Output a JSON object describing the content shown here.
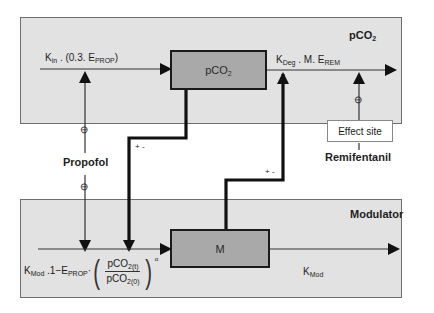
{
  "diagram": {
    "top_panel": {
      "title": "pCO",
      "title_sub": "2",
      "box_label": "pCO",
      "box_label_sub": "2",
      "input_flow": {
        "k": "K",
        "k_sub": "in",
        "rest": " . (0.3. E",
        "e_sub": "PROP",
        "close": ")"
      },
      "output_flow": {
        "k": "K",
        "k_sub": "Deg",
        "rest": " . M. E",
        "e_sub": "REM"
      },
      "effect_site_label": "Effect site"
    },
    "bottom_panel": {
      "title": "Modulator",
      "box_label": "M",
      "input_flow": {
        "k": "K",
        "k_sub": "Mod",
        "rest": " .1−E",
        "e_sub": "PROP",
        "dot": "·",
        "num": "pCO",
        "num_sub": "2(t)",
        "den": "pCO",
        "den_sub": "2(0)",
        "exponent": "α"
      },
      "output_flow": {
        "k": "K",
        "k_sub": "Mod"
      }
    },
    "drugs": {
      "left": "Propofol",
      "right": "Remifentanil"
    },
    "feedback_signs": {
      "left": "+ -",
      "right": "+ -"
    },
    "inhibition_symbol": "⊖",
    "colors": {
      "panel": "#e2e2e2",
      "box": "#a9a9a9",
      "line": "#1a1a1a"
    }
  }
}
